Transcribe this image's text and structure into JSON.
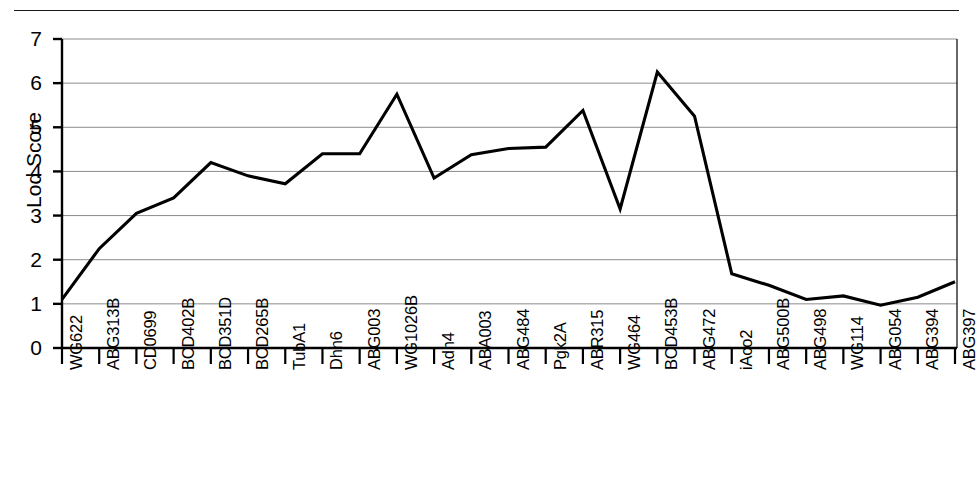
{
  "chart_data": {
    "type": "line",
    "title": "",
    "subtitle": "",
    "xlabel": "",
    "ylabel": "Lod Score",
    "ylim": [
      0,
      7
    ],
    "y_ticks": [
      0,
      1,
      2,
      3,
      4,
      5,
      6,
      7
    ],
    "grid": "horizontal",
    "legend": "none",
    "line_color": "#000000",
    "categories": [
      "WG622",
      "ABG313B",
      "CD0699",
      "BCD402B",
      "BCD351D",
      "BCD265B",
      "TubA1",
      "Dhn6",
      "ABG003",
      "WG1026B",
      "Adh4",
      "ABA003",
      "ABG484",
      "Pgk2A",
      "ABR315",
      "WG464",
      "BCD453B",
      "ABG472",
      "iAco2",
      "ABG500B",
      "ABG498",
      "WG114",
      "ABG054",
      "ABG394",
      "ABG397"
    ],
    "values": [
      1.1,
      2.25,
      3.05,
      3.4,
      4.2,
      3.9,
      3.72,
      4.4,
      4.4,
      5.75,
      3.85,
      4.38,
      4.52,
      4.55,
      5.38,
      3.15,
      6.25,
      5.25,
      1.68,
      1.42,
      1.1,
      1.18,
      0.97,
      1.15,
      1.5
    ]
  },
  "axis": {
    "y_title": "Lod Score"
  }
}
